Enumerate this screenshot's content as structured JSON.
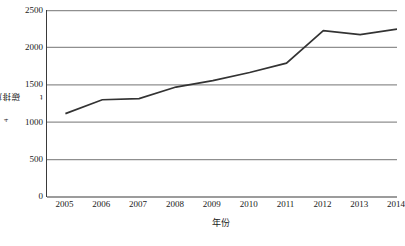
{
  "chart_data": {
    "type": "line",
    "title": "",
    "xlabel": "年份",
    "ylabel": "碳排放量/10⁴t",
    "ylabel_main": "碳排放量/10",
    "ylabel_exp": "4",
    "ylabel_unit": "t",
    "categories": [
      "2005",
      "2006",
      "2007",
      "2008",
      "2009",
      "2010",
      "2011",
      "2012",
      "2013",
      "2014"
    ],
    "x": [
      2005,
      2006,
      2007,
      2008,
      2009,
      2010,
      2011,
      2012,
      2013,
      2014
    ],
    "values": [
      1115,
      1300,
      1315,
      1470,
      1555,
      1665,
      1790,
      2225,
      2170,
      2245
    ],
    "series": [
      {
        "name": "碳排放量",
        "values": [
          1115,
          1300,
          1315,
          1470,
          1555,
          1665,
          1790,
          2225,
          2170,
          2245
        ]
      }
    ],
    "ylim": [
      0,
      2500
    ],
    "y_ticks": [
      0,
      500,
      1000,
      1500,
      2000,
      2500
    ],
    "y_tick_labels": [
      "0",
      "500",
      "1000",
      "1500",
      "2000",
      "2500"
    ],
    "grid": true,
    "grid_axis": "y",
    "legend": false,
    "legend_position": "none",
    "line_color": "#333333",
    "grid_color": "#999999",
    "axis_color": "#3a3a3a",
    "background": "#ffffff"
  }
}
